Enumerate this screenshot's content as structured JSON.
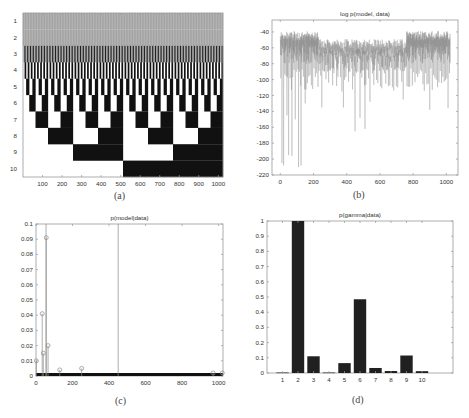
{
  "figure": {
    "captions": {
      "a": "(a)",
      "b": "(b)",
      "c": "(c)",
      "d": "(d)"
    }
  },
  "colors": {
    "ink": "#111111",
    "axis": "#9a9a9a",
    "gray_band": "#9c9c9c",
    "line": "#888888",
    "stem": "#8a8a8a",
    "bar": "#202020"
  },
  "chart_data": [
    {
      "id": "a",
      "type": "heatmap",
      "title": "",
      "xlabel": "",
      "ylabel": "",
      "description": "Binary 10 x 1024 matrix; row k toggles black/white in blocks of 2^(k-1) columns (binary enumeration of gamma vectors). Rows 1-2 appear gray due to very fine alternation.",
      "rows": 10,
      "cols": 1024,
      "block_size_by_row": [
        1,
        2,
        4,
        8,
        16,
        32,
        64,
        128,
        256,
        512
      ],
      "xticks": [
        100,
        200,
        300,
        400,
        500,
        600,
        700,
        800,
        900,
        1000
      ],
      "yticks": [
        1,
        2,
        3,
        4,
        5,
        6,
        7,
        8,
        9,
        10
      ],
      "xlim": [
        0,
        1024
      ],
      "ylim": [
        0.5,
        10.5
      ]
    },
    {
      "id": "b",
      "type": "line",
      "title": "log p(model, data)",
      "xlabel": "",
      "ylabel": "",
      "xticks": [
        0,
        200,
        400,
        600,
        800,
        1000
      ],
      "yticks": [
        -40,
        -60,
        -80,
        -100,
        -120,
        -140,
        -160,
        -180,
        -200,
        -220
      ],
      "xlim": [
        -50,
        1070
      ],
      "ylim": [
        -220,
        -25
      ],
      "series_summary": {
        "n_points": 1024,
        "upper_envelope_range": [
          -70,
          -35
        ],
        "deep_dips": [
          {
            "x": 10,
            "y": -205
          },
          {
            "x": 20,
            "y": -208
          },
          {
            "x": 50,
            "y": -195
          },
          {
            "x": 70,
            "y": -196
          },
          {
            "x": 110,
            "y": -210
          },
          {
            "x": 125,
            "y": -208
          },
          {
            "x": 40,
            "y": -145
          },
          {
            "x": 90,
            "y": -150
          },
          {
            "x": 150,
            "y": -130
          },
          {
            "x": 250,
            "y": -135
          },
          {
            "x": 380,
            "y": -135
          },
          {
            "x": 450,
            "y": -165
          },
          {
            "x": 480,
            "y": -148
          },
          {
            "x": 510,
            "y": -162
          },
          {
            "x": 540,
            "y": -128
          },
          {
            "x": 740,
            "y": -125
          },
          {
            "x": 900,
            "y": -138
          },
          {
            "x": 1010,
            "y": -136
          }
        ]
      }
    },
    {
      "id": "c",
      "type": "scatter",
      "subtype": "stem",
      "title": "p(model|data)",
      "xlabel": "",
      "ylabel": "",
      "xticks": [
        0,
        200,
        400,
        600,
        800,
        1000
      ],
      "yticks": [
        0,
        0.01,
        0.02,
        0.03,
        0.04,
        0.05,
        0.06,
        0.07,
        0.08,
        0.09,
        0.1
      ],
      "ytick_labels": [
        "0",
        "0.01",
        "0.02",
        "0.03",
        "0.04",
        "0.05",
        "0.06",
        "0.07",
        "0.08",
        "0.09",
        "0.1"
      ],
      "xlim": [
        0,
        1024
      ],
      "ylim": [
        0,
        0.1
      ],
      "points": [
        {
          "x": 2,
          "y": 0.01
        },
        {
          "x": 34,
          "y": 0.041
        },
        {
          "x": 40,
          "y": 0.015
        },
        {
          "x": 55,
          "y": 0.1
        },
        {
          "x": 56,
          "y": 0.091
        },
        {
          "x": 66,
          "y": 0.02
        },
        {
          "x": 130,
          "y": 0.004
        },
        {
          "x": 250,
          "y": 0.005
        },
        {
          "x": 450,
          "y": 0.1
        },
        {
          "x": 970,
          "y": 0.002
        },
        {
          "x": 1020,
          "y": 0.002
        }
      ],
      "baseline_note": "Remaining ~1000 models have near-zero probability forming a thick black band at y=0"
    },
    {
      "id": "d",
      "type": "bar",
      "title": "p(gamma|data)",
      "xlabel": "",
      "ylabel": "",
      "categories": [
        "1",
        "2",
        "3",
        "4",
        "5",
        "6",
        "7",
        "8",
        "9",
        "10"
      ],
      "values": [
        0.003,
        1.0,
        0.11,
        0.003,
        0.065,
        0.485,
        0.033,
        0.013,
        0.115,
        0.012
      ],
      "yticks": [
        0,
        0.1,
        0.2,
        0.3,
        0.4,
        0.5,
        0.6,
        0.7,
        0.8,
        0.9,
        1
      ],
      "xlim": [
        0,
        12
      ],
      "ylim": [
        0,
        1
      ]
    }
  ]
}
